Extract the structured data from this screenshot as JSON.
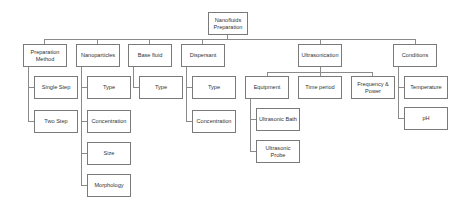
{
  "diagram": {
    "root": {
      "label": "Nanofluids Preparation"
    },
    "categories": [
      {
        "label": "Preparation Method",
        "children": [
          "Single Step",
          "Two Step"
        ]
      },
      {
        "label": "Nanoparticles",
        "children": [
          "Type",
          "Concentration",
          "Size",
          "Morphology"
        ]
      },
      {
        "label": "Base fluid",
        "children": [
          "Type"
        ]
      },
      {
        "label": "Dispersant",
        "children": [
          "Type",
          "Concentration"
        ]
      },
      {
        "label": "Ultrasonication",
        "children": [
          "Equipment",
          "Time period",
          "Frequency & Power"
        ],
        "equipment_children": [
          "Ultrasonic Bath",
          "Ultrasonic Probe"
        ]
      },
      {
        "label": "Conditions",
        "children": [
          "Temperature",
          "pH"
        ]
      }
    ]
  }
}
